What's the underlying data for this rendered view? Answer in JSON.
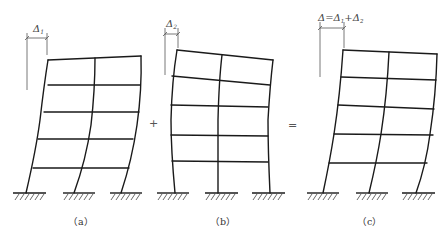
{
  "figure": {
    "panels": [
      {
        "id": "a",
        "caption": "（a）",
        "dimension_label": "Δ",
        "dimension_sub": "1",
        "deformation": "shear-type (curved columns, bending toward top)"
      },
      {
        "id": "b",
        "caption": "（b）",
        "dimension_label": "Δ",
        "dimension_sub": "2",
        "deformation": "flexural-type (overall rotation, beams tilted)"
      },
      {
        "id": "c",
        "caption": "（c）",
        "dimension_label": "Δ=Δ",
        "dimension_sub": "1",
        "dimension_mid": "+Δ",
        "dimension_sub2": "2",
        "deformation": "combined"
      }
    ],
    "operators": {
      "plus": "+",
      "equals": "="
    },
    "structure": {
      "stories": 5,
      "bays": 2
    }
  }
}
